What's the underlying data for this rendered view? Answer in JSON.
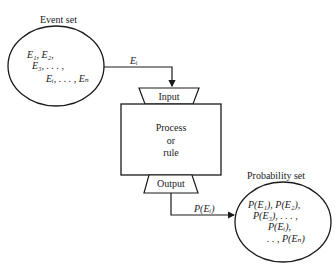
{
  "diagram": {
    "page_mark": "",
    "event_set": {
      "title": "Event set",
      "lines": [
        "E₁, E₂,",
        "E₃, . . . ,",
        "Eᵢ, . . . , Eₙ"
      ]
    },
    "input_arrow_label": "Eᵢ",
    "input_label": "Input",
    "process": {
      "line1": "Process",
      "line2": "or",
      "line3": "rule"
    },
    "output_label": "Output",
    "output_arrow_label": "P(Eᵢ)",
    "probability_set": {
      "title": "Probability set",
      "lines": [
        "P(E₁), P(E₂),",
        "P(E₃), . . . ,",
        "P(Eᵢ),",
        ". . , P(Eₙ)"
      ]
    },
    "colors": {
      "ink": "#1a1a1a",
      "background": "#ffffff"
    }
  }
}
